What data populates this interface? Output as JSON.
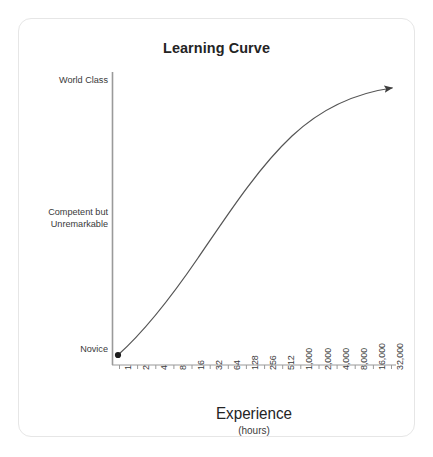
{
  "chart_data": {
    "type": "line",
    "title": "Learning Curve",
    "xlabel": "Experience",
    "xlabel_sub": "(hours)",
    "ylabel": "",
    "grid": false,
    "legend": null,
    "x_scale": "log2",
    "x_categories": [
      "1",
      "2",
      "4",
      "8",
      "16",
      "32",
      "64",
      "128",
      "256",
      "512",
      "1,000",
      "2,000",
      "4,000",
      "8,000",
      "16,000",
      "32,000"
    ],
    "y_categories": [
      "Novice",
      "Competent but\nUnremarkable",
      "World Class"
    ],
    "y_axis_labels": [
      {
        "text": "World Class",
        "position": "top"
      },
      {
        "text": "Competent but\nUnremarkable",
        "position": "middle"
      },
      {
        "text": "Novice",
        "position": "bottom"
      }
    ],
    "series": [
      {
        "name": "Skill level",
        "start_marker": "dot",
        "end_marker": "arrow",
        "points": [
          {
            "x": "1",
            "y": 0.0
          },
          {
            "x": "2",
            "y": 0.11
          },
          {
            "x": "4",
            "y": 0.22
          },
          {
            "x": "8",
            "y": 0.32
          },
          {
            "x": "16",
            "y": 0.41
          },
          {
            "x": "32",
            "y": 0.5
          },
          {
            "x": "64",
            "y": 0.58
          },
          {
            "x": "128",
            "y": 0.65
          },
          {
            "x": "256",
            "y": 0.72
          },
          {
            "x": "512",
            "y": 0.78
          },
          {
            "x": "1,000",
            "y": 0.83
          },
          {
            "x": "2,000",
            "y": 0.875
          },
          {
            "x": "4,000",
            "y": 0.915
          },
          {
            "x": "8,000",
            "y": 0.945
          },
          {
            "x": "16,000",
            "y": 0.975
          },
          {
            "x": "32,000",
            "y": 1.0
          }
        ]
      }
    ],
    "colors": {
      "curve": "#555555",
      "axis": "#9a9a9a",
      "text": "#242424",
      "tick_text": "#3a3a3a",
      "card_border": "#e6e6e6",
      "background": "#ffffff"
    }
  }
}
